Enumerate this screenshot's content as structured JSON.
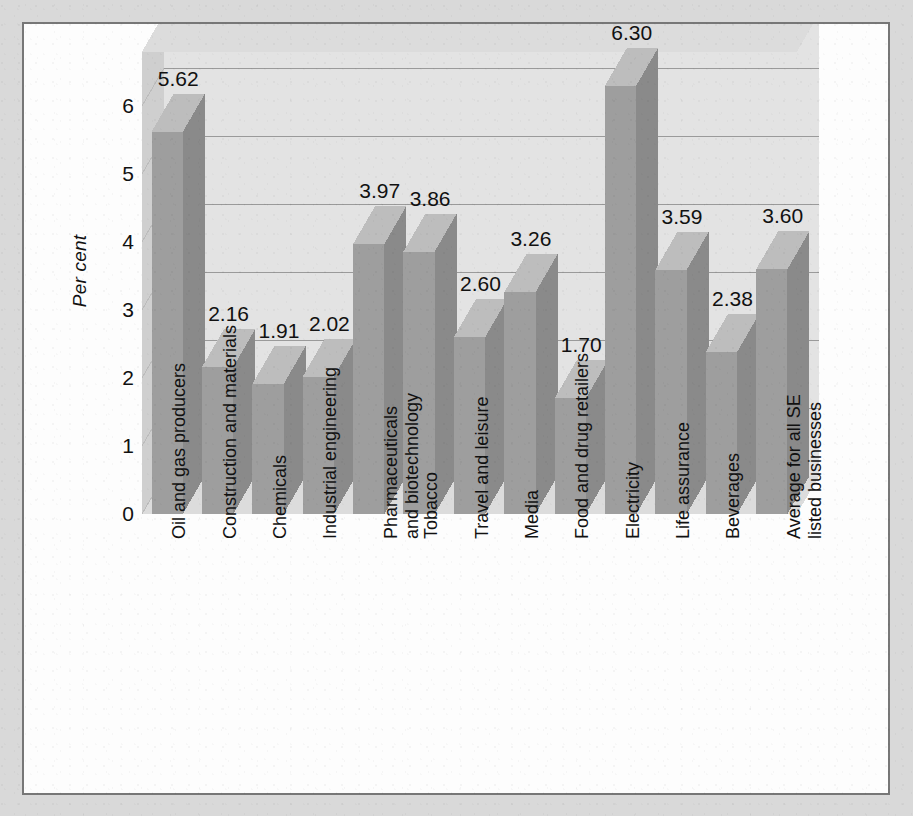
{
  "chart_data": {
    "type": "bar",
    "title": "",
    "subtitle": "",
    "xlabel": "",
    "ylabel": "Per cent",
    "ylim": [
      0,
      6.8
    ],
    "yticks": [
      "0",
      "1",
      "2",
      "3",
      "4",
      "5",
      "6"
    ],
    "grid": true,
    "legend": "none",
    "style": "3d-column",
    "categories": [
      "Oil and gas producers",
      "Construction and materials",
      "Chemicals",
      "Industrial engineering",
      "Pharmaceuticals\nand biotechnology",
      "Tobacco",
      "Travel and leisure",
      "Media",
      "Food and drug retailers",
      "Electricity",
      "Life assurance",
      "Beverages",
      "Average for all SE\nlisted businesses"
    ],
    "values": [
      5.62,
      2.16,
      1.91,
      2.02,
      3.97,
      3.86,
      2.6,
      3.26,
      1.7,
      6.3,
      3.59,
      2.38,
      3.6
    ],
    "data_labels": [
      "5.62",
      "2.16",
      "1.91",
      "2.02",
      "3.97",
      "3.86",
      "2.60",
      "3.26",
      "1.70",
      "6.30",
      "3.59",
      "2.38",
      "3.60"
    ],
    "bars": [
      {
        "label": "Oil and gas producers",
        "lines": [
          "Oil and gas producers"
        ],
        "value": 5.62,
        "data_label": "5.62"
      },
      {
        "label": "Construction and materials",
        "lines": [
          "Construction and materials"
        ],
        "value": 2.16,
        "data_label": "2.16"
      },
      {
        "label": "Chemicals",
        "lines": [
          "Chemicals"
        ],
        "value": 1.91,
        "data_label": "1.91"
      },
      {
        "label": "Industrial engineering",
        "lines": [
          "Industrial engineering"
        ],
        "value": 2.02,
        "data_label": "2.02"
      },
      {
        "label": "Pharmaceuticals and biotechnology",
        "lines": [
          "Pharmaceuticals",
          "and biotechnology"
        ],
        "value": 3.97,
        "data_label": "3.97"
      },
      {
        "label": "Tobacco",
        "lines": [
          "Tobacco"
        ],
        "value": 3.86,
        "data_label": "3.86"
      },
      {
        "label": "Travel and leisure",
        "lines": [
          "Travel and leisure"
        ],
        "value": 2.6,
        "data_label": "2.60"
      },
      {
        "label": "Media",
        "lines": [
          "Media"
        ],
        "value": 3.26,
        "data_label": "3.26"
      },
      {
        "label": "Food and drug retailers",
        "lines": [
          "Food and drug retailers"
        ],
        "value": 1.7,
        "data_label": "1.70"
      },
      {
        "label": "Electricity",
        "lines": [
          "Electricity"
        ],
        "value": 6.3,
        "data_label": "6.30"
      },
      {
        "label": "Life assurance",
        "lines": [
          "Life assurance"
        ],
        "value": 3.59,
        "data_label": "3.59"
      },
      {
        "label": "Beverages",
        "lines": [
          "Beverages"
        ],
        "value": 2.38,
        "data_label": "2.38"
      },
      {
        "label": "Average for all SE listed businesses",
        "lines": [
          "Average for all SE",
          "listed businesses"
        ],
        "value": 3.6,
        "data_label": "3.60"
      }
    ]
  },
  "colors": {
    "page_background": "#fdfdfd",
    "outer_background": "#d9d9d9",
    "page_border": "#777777",
    "plot_floor": "#e3e3e3",
    "back_wall": "#e3e3e3",
    "wall_shade": "#cfcfcf",
    "wall_top": "#dcdcdc",
    "bar_front": "#9e9e9e",
    "bar_side": "#8a8a8a",
    "bar_top": "#bdbdbd",
    "gridline": "#9a9a9a",
    "text": "#111111"
  }
}
